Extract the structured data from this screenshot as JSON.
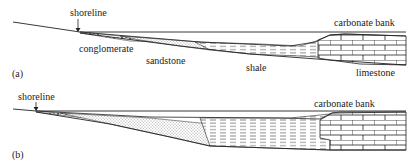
{
  "panels": [
    {
      "id": "a",
      "label": "(a)",
      "annotations": {
        "shoreline": "shoreline",
        "conglomerate": "conglomerate",
        "sandstone": "sandstone",
        "shale": "shale",
        "limestone": "limestone",
        "carbonate_bank": "carbonate bank"
      }
    },
    {
      "id": "b",
      "label": "(b)",
      "annotations": {
        "shoreline": "shoreline",
        "carbonate_bank": "carbonate bank"
      }
    }
  ],
  "colors": {
    "ink": "#222222",
    "background": "#ffffff"
  }
}
